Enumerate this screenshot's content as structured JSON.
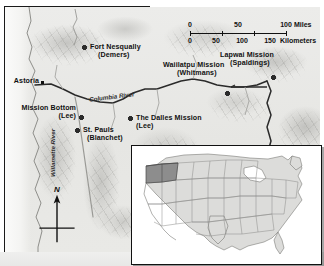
{
  "map": {
    "title": "Pacific Northwest Missions",
    "scale": {
      "miles": {
        "unit": "Miles",
        "ticks": [
          "0",
          "50",
          "100"
        ]
      },
      "kilometers": {
        "unit": "Kilometers",
        "ticks": [
          "0",
          "50",
          "100",
          "150"
        ]
      }
    },
    "compass": {
      "label": "N",
      "name": "north-arrow"
    },
    "places": [
      {
        "id": "astoria",
        "name": "Astoria",
        "sub": "",
        "type": "city",
        "x": 36,
        "y": 75,
        "label_x": 2,
        "label_y": 70,
        "align": "left"
      },
      {
        "id": "fort-nesqually",
        "name": "Fort Nesqually",
        "sub": "(Demers)",
        "type": "mission",
        "x": 79,
        "y": 40,
        "label_x": 86,
        "label_y": 37,
        "align": "left"
      },
      {
        "id": "mission-bottom",
        "name": "Mission Bottom",
        "sub": "(Lee)",
        "type": "mission",
        "x": 75,
        "y": 110,
        "label_x": 3,
        "label_y": 97,
        "align": "left"
      },
      {
        "id": "st-pauls",
        "name": "St. Pauls",
        "sub": "(Blanchet)",
        "type": "mission",
        "x": 71,
        "y": 123,
        "label_x": 79,
        "label_y": 120,
        "align": "left"
      },
      {
        "id": "dalles-mission",
        "name": "The Dalles Mission",
        "sub": "(Lee)",
        "type": "mission",
        "x": 124,
        "y": 111,
        "label_x": 133,
        "label_y": 108,
        "align": "left"
      },
      {
        "id": "waiilatpu",
        "name": "Waiilatpu Mission",
        "sub": "(Whitmans)",
        "type": "mission",
        "x": 222,
        "y": 85,
        "label_x": 159,
        "label_y": 55,
        "align": "left"
      },
      {
        "id": "lapwai",
        "name": "Lapwai Mission",
        "sub": "(Spaldings)",
        "type": "mission",
        "x": 268,
        "y": 70,
        "label_x": 216,
        "label_y": 45,
        "align": "left"
      }
    ],
    "rivers": [
      {
        "id": "columbia",
        "name": "Columbia River"
      },
      {
        "id": "willamette",
        "name": "Willamette River"
      }
    ],
    "inset": {
      "name": "united-states-locator-map",
      "highlight_region": "Pacific Northwest",
      "highlight_color": "#8d8d8d",
      "land_color": "#dcdcda"
    }
  }
}
